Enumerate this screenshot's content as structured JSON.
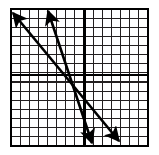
{
  "figure": {
    "background_color": "#ffffff",
    "grid_line_color": "#231f20",
    "axis_line_color": "#000000",
    "line_color": "#000000"
  },
  "chart_data": {
    "type": "line",
    "title": "",
    "xlabel": "",
    "ylabel": "",
    "xlim": [
      -8,
      7
    ],
    "ylim": [
      -8,
      7
    ],
    "grid": true,
    "legend_position": "none",
    "grid_cells_x": 15,
    "grid_cells_y": 15,
    "grid_spacing_px": 9.13,
    "plot_box_px": {
      "left": 11,
      "top": 9,
      "right": 148,
      "bottom": 146
    },
    "axes": {
      "x_axis_y_px": 75,
      "y_axis_x_px": 84,
      "origin_data": [
        0,
        0
      ],
      "x_axis_visible": true,
      "y_axis_visible": true
    },
    "series": [
      {
        "name": "line-1",
        "kind": "double-arrow-line",
        "slope": -1.21,
        "y_intercept_data": 1.3,
        "endpoints_px": [
          [
            13,
            13
          ],
          [
            119,
            141
          ]
        ],
        "endpoints_data": [
          [
            -7.8,
            6.8
          ],
          [
            3.8,
            -7.2
          ]
        ],
        "arrow_start": true,
        "arrow_end": true
      },
      {
        "name": "line-2",
        "kind": "double-arrow-line",
        "slope": -2.96,
        "y_intercept_data": -2.9,
        "endpoints_px": [
          [
            48,
            11
          ],
          [
            92,
            143
          ]
        ],
        "endpoints_data": [
          [
            -3.9,
            7.0
          ],
          [
            0.9,
            -7.5
          ]
        ],
        "arrow_start": true,
        "arrow_end": true
      }
    ],
    "intersection_px": [
      73,
      95
    ],
    "intersection_data": [
      -1.2,
      -2.2
    ]
  }
}
